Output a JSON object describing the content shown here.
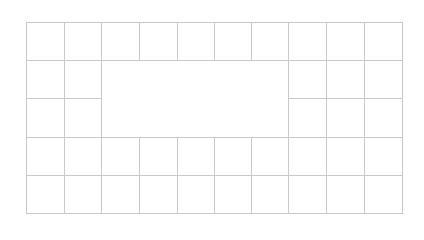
{
  "grid": {
    "origin_x": 26,
    "origin_y": 22,
    "columns": 10,
    "rows": 5,
    "col_edges": [
      26,
      64,
      101,
      139,
      177,
      214,
      251,
      288,
      326,
      364,
      402
    ],
    "row_edges": [
      22,
      60,
      98,
      137,
      175,
      213
    ],
    "line_color": "#c9c9c9",
    "hole": {
      "col_start": 2,
      "col_end": 7,
      "row_start": 1,
      "row_end": 3
    }
  }
}
